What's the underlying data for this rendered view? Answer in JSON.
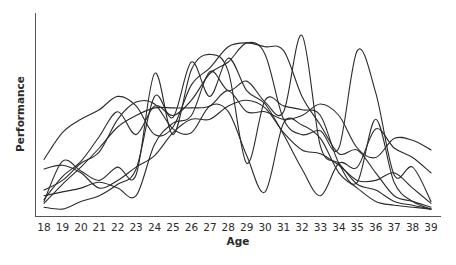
{
  "chart_data": {
    "type": "line",
    "title": "",
    "xlabel": "Age",
    "ylabel": "Performance",
    "x": [
      18,
      19,
      20,
      21,
      22,
      23,
      24,
      25,
      26,
      27,
      28,
      29,
      30,
      31,
      32,
      33,
      34,
      35,
      36,
      37,
      38,
      39
    ],
    "xlim": [
      18,
      39
    ],
    "ylim": [
      0,
      100
    ],
    "y_ticks_shown": false,
    "grid": false,
    "legend": "none",
    "colors": {
      "line": "#2b2b2b",
      "axis": "#555555",
      "text": "#2a2a2a",
      "background": "#ffffff"
    },
    "series": [
      {
        "name": "series-1",
        "values": [
          27,
          41,
          48,
          53,
          60,
          55,
          40,
          44,
          66,
          75,
          86,
          88,
          86,
          84,
          60,
          45,
          30,
          32,
          20,
          8,
          5,
          2
        ]
      },
      {
        "name": "series-2",
        "values": [
          22,
          24,
          20,
          12,
          16,
          23,
          29,
          41,
          48,
          48,
          55,
          58,
          54,
          41,
          32,
          30,
          24,
          16,
          16,
          20,
          12,
          4
        ]
      },
      {
        "name": "series-3",
        "values": [
          4,
          14,
          23,
          33,
          44,
          50,
          54,
          54,
          54,
          55,
          63,
          52,
          52,
          48,
          50,
          56,
          50,
          33,
          28,
          38,
          37,
          32
        ]
      },
      {
        "name": "series-4",
        "values": [
          8,
          10,
          12,
          15,
          12,
          8,
          35,
          46,
          50,
          73,
          63,
          68,
          57,
          52,
          92,
          34,
          25,
          14,
          11,
          5,
          3,
          1
        ]
      },
      {
        "name": "series-5",
        "values": [
          11,
          16,
          25,
          31,
          48,
          57,
          56,
          43,
          41,
          55,
          52,
          29,
          10,
          46,
          45,
          38,
          20,
          12,
          5,
          3,
          2,
          1
        ]
      },
      {
        "name": "series-6",
        "values": [
          6,
          18,
          26,
          39,
          52,
          40,
          55,
          50,
          58,
          72,
          78,
          88,
          82,
          48,
          40,
          42,
          33,
          84,
          62,
          19,
          23,
          5
        ]
      },
      {
        "name": "series-7",
        "values": [
          5,
          26,
          21,
          16,
          23,
          19,
          72,
          40,
          74,
          82,
          73,
          25,
          58,
          55,
          53,
          50,
          25,
          15,
          48,
          15,
          5,
          1
        ]
      },
      {
        "name": "series-8",
        "values": [
          2,
          1,
          5,
          8,
          14,
          22,
          60,
          49,
          78,
          60,
          80,
          63,
          56,
          40,
          22,
          8,
          25,
          23,
          43,
          33,
          28,
          20
        ]
      }
    ]
  }
}
